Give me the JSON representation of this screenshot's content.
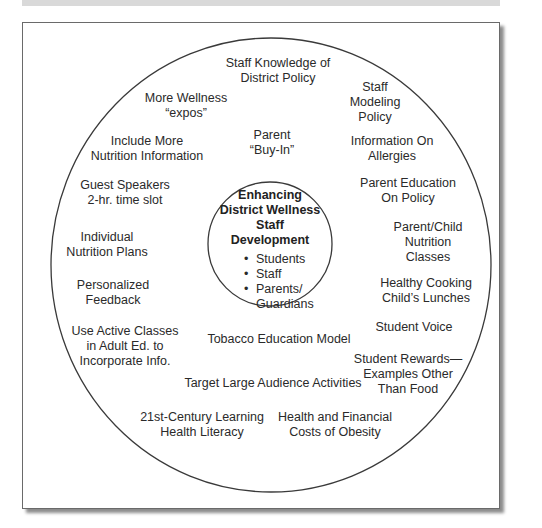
{
  "diagram": {
    "type": "concentric-circle",
    "center": {
      "title_lines": [
        "Enhancing",
        "District Wellness",
        "Staff",
        "Development"
      ],
      "audiences": [
        "Students",
        "Staff",
        "Parents/",
        "Guardians"
      ]
    },
    "items": [
      {
        "id": "staff-knowledge",
        "lines": [
          "Staff Knowledge of",
          "District Policy"
        ]
      },
      {
        "id": "staff-modeling",
        "lines": [
          "Staff",
          "Modeling",
          "Policy"
        ]
      },
      {
        "id": "more-wellness-expos",
        "lines": [
          "More Wellness",
          "“expos”"
        ]
      },
      {
        "id": "parent-buy-in",
        "lines": [
          "Parent",
          "“Buy-In”"
        ]
      },
      {
        "id": "include-nutrition-info",
        "lines": [
          "Include More",
          "Nutrition Information"
        ]
      },
      {
        "id": "information-on-allergies",
        "lines": [
          "Information On",
          "Allergies"
        ]
      },
      {
        "id": "guest-speakers",
        "lines": [
          "Guest Speakers",
          "2-hr. time slot"
        ]
      },
      {
        "id": "parent-education-policy",
        "lines": [
          "Parent Education",
          "On Policy"
        ]
      },
      {
        "id": "individual-nutrition-plans",
        "lines": [
          "Individual",
          "Nutrition Plans"
        ]
      },
      {
        "id": "parent-child-nutrition",
        "lines": [
          "Parent/Child",
          "Nutrition",
          "Classes"
        ]
      },
      {
        "id": "personalized-feedback",
        "lines": [
          "Personalized",
          "Feedback"
        ]
      },
      {
        "id": "healthy-cooking",
        "lines": [
          "Healthy Cooking",
          "Child’s Lunches"
        ]
      },
      {
        "id": "active-classes-adult-ed",
        "lines": [
          "Use Active Classes",
          "in Adult Ed. to",
          "Incorporate Info."
        ]
      },
      {
        "id": "student-voice",
        "lines": [
          "Student Voice"
        ]
      },
      {
        "id": "tobacco-education",
        "lines": [
          "Tobacco Education Model"
        ]
      },
      {
        "id": "student-rewards",
        "lines": [
          "Student Rewards—",
          "Examples Other",
          "Than Food"
        ]
      },
      {
        "id": "target-large-audience",
        "lines": [
          "Target Large Audience Activities"
        ]
      },
      {
        "id": "21st-century-learning",
        "lines": [
          "21st-Century Learning",
          "Health Literacy"
        ]
      },
      {
        "id": "health-financial-costs",
        "lines": [
          "Health and Financial",
          "Costs of Obesity"
        ]
      }
    ]
  },
  "colors": {
    "stroke": "#3a3a3a",
    "text": "#2a2a2a",
    "top_bar": "#d9d9d9"
  }
}
